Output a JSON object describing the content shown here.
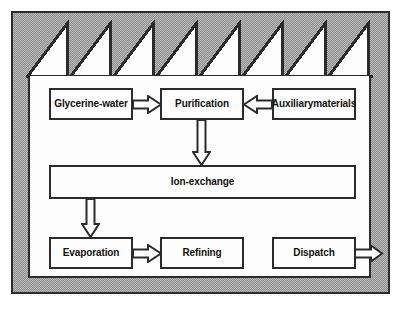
{
  "diagram": {
    "type": "process-flow-diagram",
    "colors": {
      "plate_fill": "#b9b9b9",
      "plate_hatch": "#8f8f8f",
      "line": "#2b2b2b",
      "box_fill": "#fdfdfd",
      "interior_fill": "#fdfdfd"
    },
    "building": {
      "roof_icon": "sawtooth-roof-icon",
      "sawtooth_count": 8
    },
    "nodes": [
      {
        "id": "glycerine-water",
        "label": "Glycerine-\nwater",
        "line1": "Glycerine-",
        "line2": "water"
      },
      {
        "id": "purification",
        "label": "Purification",
        "line1": "Purification",
        "line2": ""
      },
      {
        "id": "auxiliary-materials",
        "label": "Auxiliary\nmaterials",
        "line1": "Auxiliary",
        "line2": "materials"
      },
      {
        "id": "ion-exchange",
        "label": "Ion-exchange",
        "line1": "Ion-exchange",
        "line2": ""
      },
      {
        "id": "evaporation",
        "label": "Evaporation",
        "line1": "Evaporation",
        "line2": ""
      },
      {
        "id": "refining",
        "label": "Refining",
        "line1": "Refining",
        "line2": ""
      },
      {
        "id": "dispatch",
        "label": "Dispatch",
        "line1": "Dispatch",
        "line2": ""
      }
    ],
    "arrows": [
      {
        "id": "glycerine-to-purification",
        "from": "glycerine-water",
        "to": "purification",
        "direction": "right",
        "style": "hollow-block"
      },
      {
        "id": "auxiliary-to-purification",
        "from": "auxiliary-materials",
        "to": "purification",
        "direction": "left",
        "style": "hollow-block"
      },
      {
        "id": "purification-to-ion-exchange",
        "from": "purification",
        "to": "ion-exchange",
        "direction": "down",
        "style": "hollow-block"
      },
      {
        "id": "ion-exchange-to-evaporation",
        "from": "ion-exchange",
        "to": "evaporation",
        "direction": "down",
        "style": "hollow-block"
      },
      {
        "id": "evaporation-to-refining",
        "from": "evaporation",
        "to": "refining",
        "direction": "right",
        "style": "hollow-block"
      },
      {
        "id": "dispatch-to-outside",
        "from": "dispatch",
        "to": "outside",
        "direction": "right",
        "style": "hollow-block"
      }
    ]
  }
}
